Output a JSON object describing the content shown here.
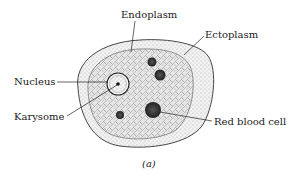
{
  "figure": {
    "type": "biology-diagram",
    "caption": "(a)",
    "labels": {
      "endoplasm": "Endoplasm",
      "ectoplasm": "Ectoplasm",
      "nucleus": "Nucleus",
      "karysome": "Karysome",
      "red_blood_cell": "Red blood cell"
    },
    "colors": {
      "ink": "#1a1a1a",
      "ectoplasm_fill": "#e8e8e8",
      "endoplasm_fill": "#d9d9d9",
      "inclusion_fill": "#333333"
    }
  }
}
